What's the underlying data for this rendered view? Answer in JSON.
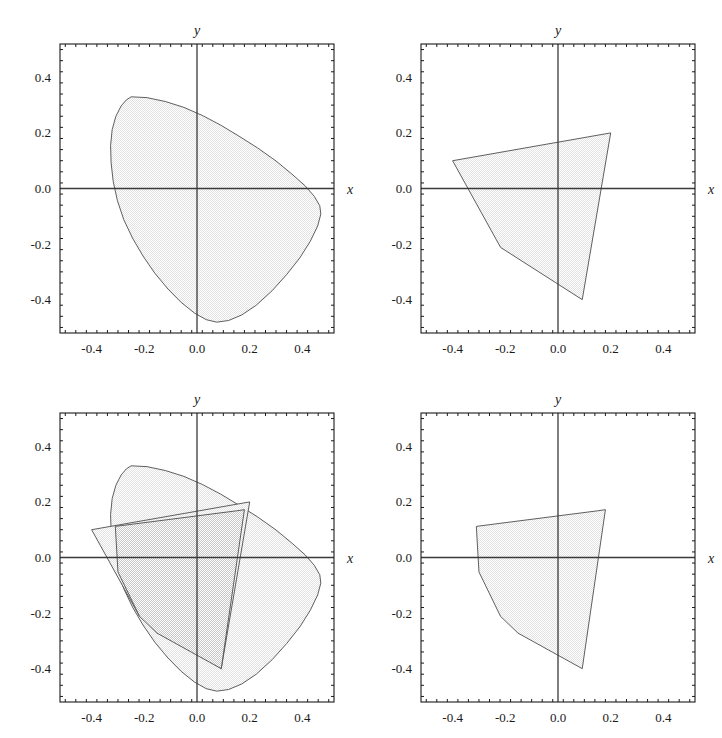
{
  "figure": {
    "kind": "2x2-plot-grid",
    "background_color": "#ffffff",
    "frame_color": "#1a1a1a",
    "axis_color": "#3a3a3a",
    "outline_color": "#4d4d4d",
    "fill_color_light": "#e2e2e2",
    "fill_color_overlap": "#c6c6c6",
    "panel_count": 4
  },
  "axes_common": {
    "xlabel": "x",
    "ylabel": "y",
    "xlim": [
      -0.52,
      0.52
    ],
    "ylim": [
      -0.52,
      0.52
    ],
    "xticks": [
      -0.4,
      -0.2,
      0.0,
      0.2,
      0.4
    ],
    "yticks": [
      -0.4,
      -0.2,
      0.0,
      0.2,
      0.4
    ],
    "xticklabels": [
      "-0.4",
      "-0.2",
      "0.0",
      "0.2",
      "0.4"
    ],
    "yticklabels": [
      "-0.4",
      "-0.2",
      "0.0",
      "0.2",
      "0.4"
    ],
    "minor_ticks_per_interval": 4,
    "grid": false,
    "frame": true
  },
  "chart_data": [
    {
      "id": "panel-top-left",
      "type": "area",
      "title": "",
      "xlabel": "x",
      "ylabel": "y",
      "xlim": [
        -0.52,
        0.52
      ],
      "ylim": [
        -0.52,
        0.52
      ],
      "xticks": [
        -0.4,
        -0.2,
        0.0,
        0.2,
        0.4
      ],
      "yticks": [
        -0.4,
        -0.2,
        0.0,
        0.2,
        0.4
      ],
      "grid": false,
      "legend": "none",
      "series": [
        {
          "name": "convex-region-A",
          "fill": "#e2e2e2",
          "closed": true,
          "points": [
            [
              -0.25,
              0.33
            ],
            [
              -0.19,
              0.327
            ],
            [
              -0.12,
              0.313
            ],
            [
              -0.05,
              0.292
            ],
            [
              0.02,
              0.263
            ],
            [
              0.09,
              0.228
            ],
            [
              0.16,
              0.188
            ],
            [
              0.23,
              0.146
            ],
            [
              0.3,
              0.099
            ],
            [
              0.36,
              0.052
            ],
            [
              0.41,
              0.01
            ],
            [
              0.445,
              -0.028
            ],
            [
              0.466,
              -0.062
            ],
            [
              0.47,
              -0.092
            ],
            [
              0.458,
              -0.135
            ],
            [
              0.43,
              -0.19
            ],
            [
              0.39,
              -0.25
            ],
            [
              0.34,
              -0.31
            ],
            [
              0.285,
              -0.368
            ],
            [
              0.225,
              -0.42
            ],
            [
              0.17,
              -0.455
            ],
            [
              0.12,
              -0.475
            ],
            [
              0.075,
              -0.481
            ],
            [
              0.035,
              -0.472
            ],
            [
              -0.01,
              -0.448
            ],
            [
              -0.06,
              -0.41
            ],
            [
              -0.11,
              -0.362
            ],
            [
              -0.16,
              -0.305
            ],
            [
              -0.205,
              -0.243
            ],
            [
              -0.245,
              -0.178
            ],
            [
              -0.278,
              -0.112
            ],
            [
              -0.302,
              -0.044
            ],
            [
              -0.318,
              0.025
            ],
            [
              -0.326,
              0.092
            ],
            [
              -0.328,
              0.155
            ],
            [
              -0.322,
              0.212
            ],
            [
              -0.308,
              0.26
            ],
            [
              -0.288,
              0.297
            ],
            [
              -0.268,
              0.319
            ]
          ]
        }
      ]
    },
    {
      "id": "panel-top-right",
      "type": "area",
      "title": "",
      "xlabel": "x",
      "ylabel": "y",
      "xlim": [
        -0.52,
        0.52
      ],
      "ylim": [
        -0.52,
        0.52
      ],
      "xticks": [
        -0.4,
        -0.2,
        0.0,
        0.2,
        0.4
      ],
      "yticks": [
        -0.4,
        -0.2,
        0.0,
        0.2,
        0.4
      ],
      "grid": false,
      "legend": "none",
      "series": [
        {
          "name": "polygon-region-B",
          "fill": "#e2e2e2",
          "closed": true,
          "points": [
            [
              -0.4,
              0.1
            ],
            [
              0.2,
              0.2
            ],
            [
              0.092,
              -0.4
            ],
            [
              -0.218,
              -0.212
            ]
          ]
        }
      ]
    },
    {
      "id": "panel-bottom-left",
      "type": "area",
      "title": "",
      "xlabel": "x",
      "ylabel": "y",
      "xlim": [
        -0.52,
        0.52
      ],
      "ylim": [
        -0.52,
        0.52
      ],
      "xticks": [
        -0.4,
        -0.2,
        0.0,
        0.2,
        0.4
      ],
      "yticks": [
        -0.4,
        -0.2,
        0.0,
        0.2,
        0.4
      ],
      "grid": false,
      "legend": "none",
      "series": [
        {
          "name": "convex-region-A",
          "fill": "#e2e2e2",
          "closed": true,
          "points": [
            [
              -0.25,
              0.33
            ],
            [
              -0.19,
              0.327
            ],
            [
              -0.12,
              0.313
            ],
            [
              -0.05,
              0.292
            ],
            [
              0.02,
              0.263
            ],
            [
              0.09,
              0.228
            ],
            [
              0.16,
              0.188
            ],
            [
              0.23,
              0.146
            ],
            [
              0.3,
              0.099
            ],
            [
              0.36,
              0.052
            ],
            [
              0.41,
              0.01
            ],
            [
              0.445,
              -0.028
            ],
            [
              0.466,
              -0.062
            ],
            [
              0.47,
              -0.092
            ],
            [
              0.458,
              -0.135
            ],
            [
              0.43,
              -0.19
            ],
            [
              0.39,
              -0.25
            ],
            [
              0.34,
              -0.31
            ],
            [
              0.285,
              -0.368
            ],
            [
              0.225,
              -0.42
            ],
            [
              0.17,
              -0.455
            ],
            [
              0.12,
              -0.475
            ],
            [
              0.075,
              -0.481
            ],
            [
              0.035,
              -0.472
            ],
            [
              -0.01,
              -0.448
            ],
            [
              -0.06,
              -0.41
            ],
            [
              -0.11,
              -0.362
            ],
            [
              -0.16,
              -0.305
            ],
            [
              -0.205,
              -0.243
            ],
            [
              -0.245,
              -0.178
            ],
            [
              -0.278,
              -0.112
            ],
            [
              -0.302,
              -0.044
            ],
            [
              -0.318,
              0.025
            ],
            [
              -0.326,
              0.092
            ],
            [
              -0.328,
              0.155
            ],
            [
              -0.322,
              0.212
            ],
            [
              -0.308,
              0.26
            ],
            [
              -0.288,
              0.297
            ],
            [
              -0.268,
              0.319
            ]
          ]
        },
        {
          "name": "polygon-region-B",
          "fill": "#e2e2e2",
          "closed": true,
          "points": [
            [
              -0.4,
              0.1
            ],
            [
              0.2,
              0.2
            ],
            [
              0.092,
              -0.4
            ],
            [
              -0.218,
              -0.212
            ]
          ]
        },
        {
          "name": "intersection-region",
          "fill": "#c6c6c6",
          "closed": true,
          "points": [
            [
              -0.31,
              0.112
            ],
            [
              0.15,
              0.168
            ],
            [
              0.18,
              0.172
            ],
            [
              0.092,
              -0.4
            ],
            [
              -0.152,
              -0.272
            ],
            [
              -0.218,
              -0.212
            ],
            [
              -0.3,
              -0.052
            ]
          ]
        }
      ]
    },
    {
      "id": "panel-bottom-right",
      "type": "area",
      "title": "",
      "xlabel": "x",
      "ylabel": "y",
      "xlim": [
        -0.52,
        0.52
      ],
      "ylim": [
        -0.52,
        0.52
      ],
      "xticks": [
        -0.4,
        -0.2,
        0.0,
        0.2,
        0.4
      ],
      "yticks": [
        -0.4,
        -0.2,
        0.0,
        0.2,
        0.4
      ],
      "grid": false,
      "legend": "none",
      "series": [
        {
          "name": "intersection-region",
          "fill": "#e2e2e2",
          "closed": true,
          "points": [
            [
              -0.31,
              0.112
            ],
            [
              0.15,
              0.168
            ],
            [
              0.18,
              0.172
            ],
            [
              0.092,
              -0.4
            ],
            [
              -0.152,
              -0.272
            ],
            [
              -0.218,
              -0.212
            ],
            [
              -0.3,
              -0.052
            ]
          ]
        }
      ]
    }
  ]
}
